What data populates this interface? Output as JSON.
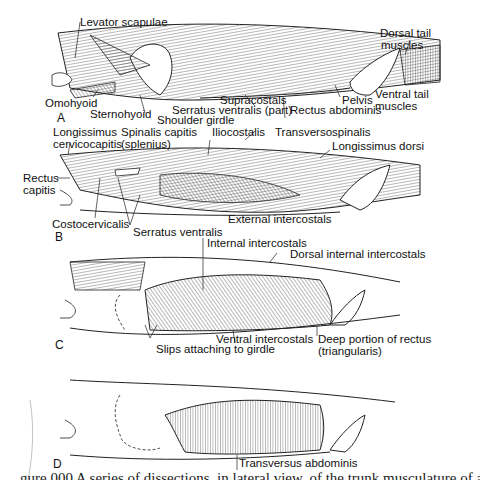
{
  "figure": {
    "panels": [
      {
        "id": "A",
        "labels": [
          "Levator scapulae",
          "Dorsal tail muscles",
          "Omohyoid",
          "Sternohyoid",
          "Shoulder girdle",
          "Serratus ventralis (part)",
          "Supracostals",
          "Rectus abdominis",
          "Pelvis",
          "Ventral tail muscles"
        ]
      },
      {
        "id": "B",
        "labels": [
          "Longissimus cervicocapitis",
          "Spinalis capitis (splenius)",
          "Iliocostalis",
          "Transversospinalis",
          "Longissimus dorsi",
          "Rectus capitis",
          "Costocervicalis",
          "Serratus ventralis",
          "External intercostals"
        ]
      },
      {
        "id": "C",
        "labels": [
          "Internal intercostals",
          "Dorsal internal intercostals",
          "Ventral intercostals",
          "Slips attaching to girdle",
          "Deep portion of rectus (triangularis)"
        ]
      },
      {
        "id": "D",
        "labels": [
          "Transversus abdominis"
        ]
      }
    ],
    "text": {
      "a": {
        "panel": "A",
        "levator": "Levator scapulae",
        "dorsal_tail_1": "Dorsal tail",
        "dorsal_tail_2": "muscles",
        "omohyoid": "Omohyoid",
        "sternohyoid": "Sternohyoid",
        "shoulder": "Shoulder girdle",
        "serratus": "Serratus ventralis (part)",
        "supracostals": "Supracostals",
        "rectus": "Rectus abdominis",
        "pelvis": "Pelvis",
        "ventral_tail_1": "Ventral tail",
        "ventral_tail_2": "muscles"
      },
      "b": {
        "panel": "B",
        "longissimus_1": "Longissimus",
        "longissimus_2": "cervicocapitis",
        "spinalis_1": "Spinalis capitis",
        "spinalis_2": "(splenius)",
        "iliocostalis": "Iliocostalis",
        "transverso": "Transversospinalis",
        "longdorsi": "Longissimus dorsi",
        "rectus_cap_1": "Rectus",
        "rectus_cap_2": "capitis",
        "costocerv": "Costocervicalis",
        "serratus": "Serratus ventralis",
        "external": "External intercostals"
      },
      "c": {
        "panel": "C",
        "internal": "Internal intercostals",
        "dorsal_internal": "Dorsal internal intercostals",
        "ventral": "Ventral intercostals",
        "slips": "Slips attaching to girdle",
        "deep_1": "Deep portion of rectus",
        "deep_2": "(triangularis)"
      },
      "d": {
        "panel": "D",
        "transversus": "Transversus abdominis"
      }
    },
    "caption_partial": "gure 000   A series of dissections, in lateral view, of the trunk musculature of a"
  }
}
